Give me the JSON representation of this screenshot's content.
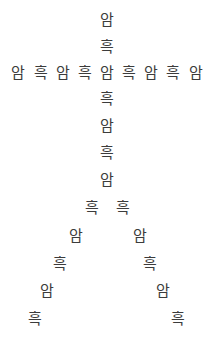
{
  "canvas": {
    "width": 214,
    "height": 349,
    "background": "#ffffff",
    "text_color": "#3c3c3c",
    "font_size_px": 15
  },
  "pattern": {
    "name": "korean-character-tree",
    "description": "Korean syllables arranged in a tree / inverted-V figure",
    "characters_used": [
      "암",
      "흑"
    ],
    "stem_center_x": 107
  },
  "glyphs": [
    {
      "text": "암",
      "x": 107,
      "y": 20,
      "group": "stem-upper",
      "index": 0
    },
    {
      "text": "흑",
      "x": 107,
      "y": 47,
      "group": "stem-upper",
      "index": 1
    },
    {
      "text": "암",
      "x": 18,
      "y": 73,
      "group": "crossbar",
      "index": 0
    },
    {
      "text": "흑",
      "x": 41,
      "y": 73,
      "group": "crossbar",
      "index": 1
    },
    {
      "text": "암",
      "x": 63,
      "y": 73,
      "group": "crossbar",
      "index": 2
    },
    {
      "text": "흑",
      "x": 85,
      "y": 73,
      "group": "crossbar",
      "index": 3
    },
    {
      "text": "암",
      "x": 107,
      "y": 73,
      "group": "crossbar",
      "index": 4
    },
    {
      "text": "흑",
      "x": 129,
      "y": 73,
      "group": "crossbar",
      "index": 5
    },
    {
      "text": "암",
      "x": 151,
      "y": 73,
      "group": "crossbar",
      "index": 6
    },
    {
      "text": "흑",
      "x": 173,
      "y": 73,
      "group": "crossbar",
      "index": 7
    },
    {
      "text": "암",
      "x": 196,
      "y": 73,
      "group": "crossbar",
      "index": 8
    },
    {
      "text": "흑",
      "x": 107,
      "y": 99,
      "group": "stem-lower",
      "index": 0
    },
    {
      "text": "암",
      "x": 107,
      "y": 126,
      "group": "stem-lower",
      "index": 1
    },
    {
      "text": "흑",
      "x": 107,
      "y": 153,
      "group": "stem-lower",
      "index": 2
    },
    {
      "text": "암",
      "x": 107,
      "y": 180,
      "group": "stem-lower",
      "index": 3
    },
    {
      "text": "흑",
      "x": 92,
      "y": 208,
      "group": "branch-left",
      "index": 0
    },
    {
      "text": "암",
      "x": 76,
      "y": 236,
      "group": "branch-left",
      "index": 1
    },
    {
      "text": "흑",
      "x": 60,
      "y": 264,
      "group": "branch-left",
      "index": 2
    },
    {
      "text": "암",
      "x": 47,
      "y": 291,
      "group": "branch-left",
      "index": 3
    },
    {
      "text": "흑",
      "x": 35,
      "y": 319,
      "group": "branch-left",
      "index": 4
    },
    {
      "text": "흑",
      "x": 123,
      "y": 208,
      "group": "branch-right",
      "index": 0
    },
    {
      "text": "암",
      "x": 140,
      "y": 236,
      "group": "branch-right",
      "index": 1
    },
    {
      "text": "흑",
      "x": 150,
      "y": 264,
      "group": "branch-right",
      "index": 2
    },
    {
      "text": "암",
      "x": 163,
      "y": 291,
      "group": "branch-right",
      "index": 3
    },
    {
      "text": "흑",
      "x": 178,
      "y": 319,
      "group": "branch-right",
      "index": 4
    }
  ]
}
